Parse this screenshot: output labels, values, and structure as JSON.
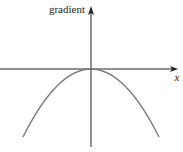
{
  "diagram": {
    "y_axis_label": "gradient",
    "x_axis_label": "x",
    "curve": {
      "type": "downward-parabola",
      "description": "gradient vs x, maximum of zero at the origin",
      "vertex": [
        0,
        0
      ],
      "color": "#7a7a7a"
    },
    "axis_color": "#222222"
  }
}
